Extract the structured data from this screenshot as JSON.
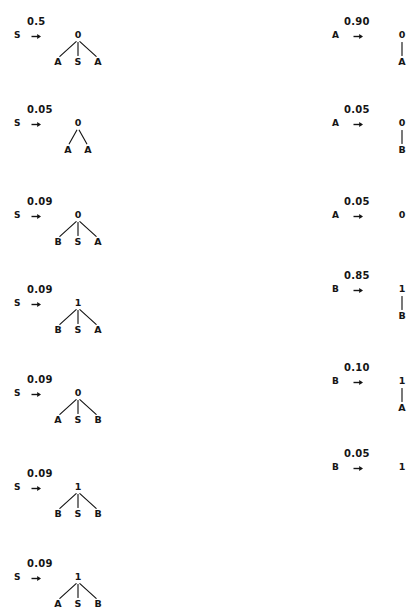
{
  "figure": {
    "kind": "pcfg-production-rules",
    "arrow_glyph": "→",
    "ink_color": "#151515",
    "background_color": "#ffffff"
  },
  "columns": [
    {
      "name": "left-column",
      "rules": [
        {
          "id": "rule-s-1",
          "lhs": "S",
          "arrow": "→",
          "probability": "0.5",
          "root": "0",
          "children": [
            "A",
            "S",
            "A"
          ]
        },
        {
          "id": "rule-s-2",
          "lhs": "S",
          "arrow": "→",
          "probability": "0.05",
          "root": "0",
          "children": [
            "A",
            "A"
          ]
        },
        {
          "id": "rule-s-3",
          "lhs": "S",
          "arrow": "→",
          "probability": "0.09",
          "root": "0",
          "children": [
            "B",
            "S",
            "A"
          ]
        },
        {
          "id": "rule-s-4",
          "lhs": "S",
          "arrow": "→",
          "probability": "0.09",
          "root": "1",
          "children": [
            "B",
            "S",
            "A"
          ]
        },
        {
          "id": "rule-s-5",
          "lhs": "S",
          "arrow": "→",
          "probability": "0.09",
          "root": "0",
          "children": [
            "A",
            "S",
            "B"
          ]
        },
        {
          "id": "rule-s-6",
          "lhs": "S",
          "arrow": "→",
          "probability": "0.09",
          "root": "1",
          "children": [
            "B",
            "S",
            "B"
          ]
        },
        {
          "id": "rule-s-7",
          "lhs": "S",
          "arrow": "→",
          "probability": "0.09",
          "root": "1",
          "children": [
            "A",
            "S",
            "B"
          ]
        }
      ]
    },
    {
      "name": "right-column",
      "rules": [
        {
          "id": "rule-a-1",
          "lhs": "A",
          "arrow": "→",
          "probability": "0.90",
          "root": "0",
          "children": [
            "A"
          ]
        },
        {
          "id": "rule-a-2",
          "lhs": "A",
          "arrow": "→",
          "probability": "0.05",
          "root": "0",
          "children": [
            "B"
          ]
        },
        {
          "id": "rule-a-3",
          "lhs": "A",
          "arrow": "→",
          "probability": "0.05",
          "root": "0",
          "children": []
        },
        {
          "id": "rule-b-1",
          "lhs": "B",
          "arrow": "→",
          "probability": "0.85",
          "root": "1",
          "children": [
            "B"
          ]
        },
        {
          "id": "rule-b-2",
          "lhs": "B",
          "arrow": "→",
          "probability": "0.10",
          "root": "1",
          "children": [
            "A"
          ]
        },
        {
          "id": "rule-b-3",
          "lhs": "B",
          "arrow": "→",
          "probability": "0.05",
          "root": "1",
          "children": []
        }
      ]
    }
  ],
  "layout": {
    "left": {
      "lhs_x": 14,
      "arrow_x": 31,
      "prob_x": 27,
      "tree_x": 48,
      "baseline_y": [
        38,
        126,
        218,
        306,
        396,
        490,
        580
      ]
    },
    "right": {
      "lhs_x": 332,
      "arrow_x": 353,
      "prob_x": 344,
      "tree_x": 372,
      "baseline_y": [
        38,
        126,
        218,
        292,
        384,
        470
      ]
    }
  }
}
